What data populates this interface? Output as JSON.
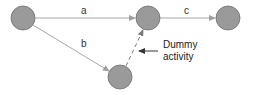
{
  "diagram": {
    "type": "activity-on-arrow network",
    "nodes": [
      {
        "id": "n1",
        "cx": 23,
        "cy": 18,
        "r": 12
      },
      {
        "id": "n2",
        "cx": 148,
        "cy": 18,
        "r": 12
      },
      {
        "id": "n3",
        "cx": 228,
        "cy": 18,
        "r": 12
      },
      {
        "id": "n4",
        "cx": 120,
        "cy": 77,
        "r": 12
      }
    ],
    "edges": [
      {
        "from": "n1",
        "to": "n2",
        "label": "a",
        "style": "solid"
      },
      {
        "from": "n1",
        "to": "n4",
        "label": "b",
        "style": "solid"
      },
      {
        "from": "n2",
        "to": "n3",
        "label": "c",
        "style": "solid"
      },
      {
        "from": "n4",
        "to": "n2",
        "label": "",
        "style": "dashed"
      }
    ],
    "labels": {
      "a": "a",
      "b": "b",
      "c": "c"
    },
    "annotation": {
      "line1": "Dummy",
      "line2": "activity"
    },
    "colors": {
      "node_fill": "#9a9a9a",
      "node_stroke": "#6e6e6e",
      "edge": "#a8a8a8",
      "dummy": "#7a7a7a",
      "pointer": "#333333"
    }
  }
}
